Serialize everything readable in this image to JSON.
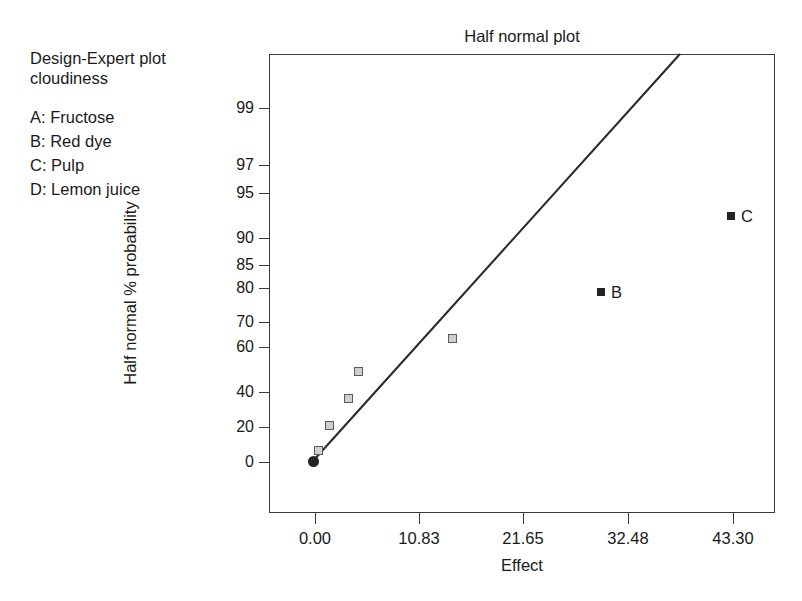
{
  "annotation": {
    "header_lines": [
      "Design-Expert plot",
      "cloudiness"
    ],
    "factors": [
      "A: Fructose",
      "B: Red dye",
      "C: Pulp",
      "D: Lemon juice"
    ]
  },
  "chart_data": {
    "type": "scatter",
    "title": "Half normal plot",
    "xlabel": "Effect",
    "ylabel": "Half normal % probability",
    "grid": false,
    "legend": "none",
    "xlim": [
      0.0,
      46.5
    ],
    "ylim": [
      0,
      99.9
    ],
    "xticks": [
      0.0,
      10.83,
      21.65,
      32.48,
      43.3
    ],
    "xtick_labels": [
      "0.00",
      "10.83",
      "21.65",
      "32.48",
      "43.30"
    ],
    "yticks": [
      0,
      20,
      40,
      60,
      70,
      80,
      85,
      90,
      95,
      97,
      99
    ],
    "ytick_labels": [
      "0",
      "20",
      "40",
      "60",
      "70",
      "80",
      "85",
      "90",
      "95",
      "97",
      "99"
    ],
    "series": [
      {
        "name": "unlabeled effects",
        "marker": "open-square",
        "points": [
          {
            "x": 0.2,
            "y": 7.0,
            "label": ""
          },
          {
            "x": 0.55,
            "y": 21.5,
            "label": ""
          },
          {
            "x": 1.2,
            "y": 36.5,
            "label": ""
          },
          {
            "x": 1.55,
            "y": 49.5,
            "label": ""
          },
          {
            "x": 4.75,
            "y": 64.5,
            "label": ""
          }
        ]
      },
      {
        "name": "significant effects",
        "marker": "filled-square",
        "points": [
          {
            "x": 29.9,
            "y": 79.0,
            "label": "B"
          },
          {
            "x": 43.4,
            "y": 92.5,
            "label": "C"
          }
        ]
      },
      {
        "name": "origin",
        "marker": "filled-circle",
        "points": [
          {
            "x": 0.05,
            "y": 0.6,
            "label": ""
          }
        ]
      }
    ],
    "reference_line": {
      "name": "half-normal reference line",
      "from": {
        "x": 0.05,
        "y": 0.6
      },
      "to": {
        "x": 20.0,
        "y": 99.9
      }
    },
    "colors": {
      "axis": "#3a3a3a",
      "open_marker_fill": "#cfcfcf",
      "open_marker_edge": "#5b5b5b",
      "filled_marker": "#232323",
      "line": "#2b2b2b",
      "text": "#1a1a1a"
    }
  },
  "geometry": {
    "plot": {
      "left": 269,
      "top": 54,
      "width": 506,
      "height": 459
    },
    "x_tick_px": [
      315,
      419,
      523,
      628,
      733
    ],
    "y_tick_px": [
      462,
      427,
      392,
      347,
      322,
      288,
      265,
      238,
      193,
      165,
      108
    ],
    "open_points_px": [
      [
        318,
        450
      ],
      [
        329,
        425
      ],
      [
        348,
        398
      ],
      [
        358,
        371
      ],
      [
        452,
        338
      ]
    ],
    "filled_points_px": [
      [
        601,
        292
      ],
      [
        731,
        216
      ]
    ],
    "origin_point_px": [
      313,
      461
    ],
    "line_px": {
      "x1": 313,
      "y1": 461,
      "x2": 680,
      "y2": 54
    }
  }
}
